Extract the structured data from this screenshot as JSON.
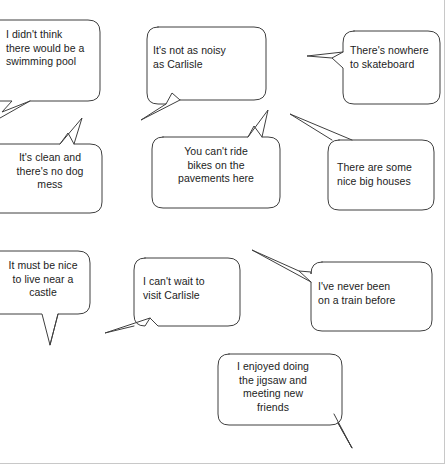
{
  "document": {
    "title": "Children's comments speech bubbles",
    "background_color": "#ffffff",
    "ink_color": "#3a3a3a",
    "text_color": "#1c1c1c",
    "border_color": "#c8c8c8",
    "width": 445,
    "height": 464
  },
  "bubbles": [
    {
      "id": "swimming-pool",
      "text": "I didn't think\nthere would be a\nswimming pool",
      "align": "left",
      "cropped_left": true,
      "tail_direction": "down-left"
    },
    {
      "id": "not-as-noisy",
      "text": "It's not as noisy\nas Carlisle",
      "align": "left",
      "cropped_left": false,
      "tail_direction": "down-left"
    },
    {
      "id": "nowhere-to-skateboard",
      "text": "There's nowhere\nto skateboard",
      "align": "left",
      "cropped_left": false,
      "tail_direction": "left"
    },
    {
      "id": "clean-no-dog-mess",
      "text": "It's clean and\nthere's no dog\nmess",
      "align": "center",
      "cropped_left": true,
      "tail_direction": "up-right"
    },
    {
      "id": "bikes-pavements",
      "text": "You can't ride\nbikes on the\npavements here",
      "align": "center",
      "cropped_left": false,
      "tail_direction": "up-right"
    },
    {
      "id": "nice-big-houses",
      "text": "There are some\nnice big houses",
      "align": "left",
      "cropped_left": false,
      "tail_direction": "up-left"
    },
    {
      "id": "live-near-castle",
      "text": "It must be nice\nto live near a\ncastle",
      "align": "center",
      "cropped_left": true,
      "tail_direction": "down"
    },
    {
      "id": "visit-carlisle",
      "text": "I can't wait to\nvisit Carlisle",
      "align": "left",
      "cropped_left": false,
      "tail_direction": "down-left"
    },
    {
      "id": "never-been-on-train",
      "text": "I've never been\non a train before",
      "align": "left",
      "cropped_left": false,
      "tail_direction": "up-left"
    },
    {
      "id": "jigsaw-new-friends",
      "text": "I enjoyed doing\nthe jigsaw and\nmeeting new\nfriends",
      "align": "center",
      "cropped_left": false,
      "tail_direction": "down-right"
    }
  ]
}
